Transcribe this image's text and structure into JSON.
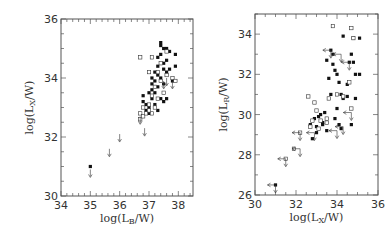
{
  "chart_data": [
    {
      "type": "scatter",
      "title": "",
      "xlabel": "log(L_B/W)",
      "ylabel": "log(L_X/W)",
      "xlim": [
        34,
        38.5
      ],
      "ylim": [
        30,
        36
      ],
      "xticks": [
        34,
        35,
        36,
        37,
        38
      ],
      "yticks": [
        30,
        32,
        34,
        36
      ],
      "grid": false,
      "legend": null,
      "frame": {
        "x0": 61,
        "x1": 193,
        "y0": 19,
        "y1": 196
      },
      "series": [
        {
          "name": "filled",
          "marker": "filled-square",
          "points": [
            [
              35.0,
              31.0
            ],
            [
              36.8,
              33.4
            ],
            [
              36.8,
              33.2
            ],
            [
              36.9,
              32.9
            ],
            [
              37.0,
              33.0
            ],
            [
              37.1,
              33.3
            ],
            [
              37.1,
              33.6
            ],
            [
              37.2,
              33.9
            ],
            [
              37.2,
              34.2
            ],
            [
              37.3,
              34.4
            ],
            [
              37.3,
              34.7
            ],
            [
              37.4,
              35.1
            ],
            [
              37.4,
              34.8
            ],
            [
              37.5,
              35.0
            ],
            [
              37.5,
              34.5
            ],
            [
              37.6,
              34.2
            ],
            [
              37.4,
              34.0
            ],
            [
              37.3,
              33.7
            ],
            [
              37.2,
              33.5
            ],
            [
              37.5,
              33.8
            ],
            [
              37.6,
              34.6
            ],
            [
              37.7,
              34.9
            ],
            [
              37.6,
              33.3
            ],
            [
              37.5,
              33.2
            ],
            [
              37.9,
              34.8
            ],
            [
              37.9,
              34.4
            ],
            [
              37.8,
              33.9
            ],
            [
              37.0,
              33.5
            ],
            [
              37.2,
              33.1
            ],
            [
              37.4,
              33.3
            ],
            [
              37.1,
              34.0
            ],
            [
              37.3,
              34.1
            ],
            [
              37.5,
              34.3
            ],
            [
              37.7,
              34.3
            ],
            [
              37.4,
              35.2
            ],
            [
              37.6,
              35.0
            ],
            [
              36.9,
              33.1
            ],
            [
              37.1,
              33.8
            ],
            [
              37.3,
              32.9
            ],
            [
              37.0,
              32.8
            ]
          ]
        },
        {
          "name": "open",
          "marker": "open-square",
          "points": [
            [
              36.7,
              32.8
            ],
            [
              36.7,
              32.6
            ],
            [
              36.8,
              32.7
            ],
            [
              36.9,
              32.8
            ],
            [
              37.0,
              33.1
            ],
            [
              37.1,
              32.8
            ],
            [
              37.2,
              33.0
            ],
            [
              37.1,
              33.4
            ],
            [
              37.0,
              34.2
            ],
            [
              37.1,
              34.7
            ],
            [
              36.7,
              34.7
            ],
            [
              37.3,
              34.2
            ],
            [
              37.4,
              33.9
            ],
            [
              37.6,
              34.1
            ],
            [
              37.8,
              34.0
            ],
            [
              37.9,
              33.9
            ],
            [
              37.5,
              33.5
            ],
            [
              37.3,
              33.3
            ],
            [
              37.2,
              33.7
            ],
            [
              37.4,
              34.5
            ],
            [
              37.6,
              34.9
            ],
            [
              37.0,
              32.9
            ],
            [
              36.8,
              33.0
            ]
          ]
        },
        {
          "name": "upper-limits",
          "marker": "down-arrow",
          "points": [
            [
              35.0,
              30.9
            ],
            [
              35.65,
              31.6
            ],
            [
              36.0,
              32.1
            ],
            [
              36.85,
              32.3
            ],
            [
              36.7,
              32.7
            ],
            [
              37.5,
              33.9
            ],
            [
              37.8,
              33.9
            ],
            [
              37.6,
              34.0
            ]
          ]
        }
      ]
    },
    {
      "type": "scatter",
      "title": "",
      "xlabel": "log(L_X/W)",
      "ylabel": "log(L_R/W)",
      "xlim": [
        30,
        36
      ],
      "ylim": [
        26,
        35
      ],
      "xticks": [
        30,
        32,
        34,
        36
      ],
      "yticks": [
        26,
        28,
        30,
        32,
        34
      ],
      "grid": false,
      "legend": null,
      "frame": {
        "x0": 255,
        "x1": 378,
        "y0": 14,
        "y1": 195
      },
      "series": [
        {
          "name": "filled",
          "marker": "filled-square",
          "points": [
            [
              31.0,
              26.5
            ],
            [
              32.7,
              29.5
            ],
            [
              32.9,
              29.8
            ],
            [
              33.0,
              29.4
            ],
            [
              33.1,
              29.9
            ],
            [
              33.2,
              30.0
            ],
            [
              33.3,
              29.6
            ],
            [
              33.4,
              30.1
            ],
            [
              33.5,
              29.2
            ],
            [
              33.6,
              31.8
            ],
            [
              33.5,
              32.7
            ],
            [
              33.7,
              33.2
            ],
            [
              33.8,
              33.0
            ],
            [
              33.8,
              32.5
            ],
            [
              33.9,
              32.2
            ],
            [
              34.0,
              32.0
            ],
            [
              34.1,
              31.6
            ],
            [
              34.2,
              31.0
            ],
            [
              34.3,
              30.8
            ],
            [
              34.0,
              30.3
            ],
            [
              33.9,
              29.8
            ],
            [
              34.1,
              29.5
            ],
            [
              34.2,
              29.3
            ],
            [
              34.5,
              31.5
            ],
            [
              34.6,
              32.6
            ],
            [
              34.7,
              33.0
            ],
            [
              34.8,
              32.6
            ],
            [
              34.9,
              32.0
            ],
            [
              34.5,
              30.9
            ],
            [
              34.7,
              29.5
            ],
            [
              34.3,
              33.9
            ],
            [
              34.8,
              33.8
            ],
            [
              35.1,
              33.8
            ],
            [
              35.1,
              32.0
            ],
            [
              34.9,
              30.8
            ],
            [
              33.7,
              31.0
            ],
            [
              33.3,
              29.5
            ],
            [
              33.0,
              29.1
            ],
            [
              32.8,
              28.8
            ]
          ]
        },
        {
          "name": "open",
          "marker": "open-square",
          "points": [
            [
              32.2,
              29.1
            ],
            [
              31.9,
              28.3
            ],
            [
              31.5,
              27.8
            ],
            [
              32.6,
              30.9
            ],
            [
              32.9,
              30.6
            ],
            [
              33.0,
              30.2
            ],
            [
              32.8,
              29.7
            ],
            [
              32.7,
              29.4
            ],
            [
              33.2,
              29.7
            ],
            [
              33.5,
              29.8
            ],
            [
              33.8,
              34.4
            ],
            [
              34.7,
              34.3
            ],
            [
              34.8,
              33.8
            ],
            [
              34.0,
              31.0
            ],
            [
              34.3,
              30.9
            ],
            [
              34.6,
              31.6
            ],
            [
              34.7,
              30.3
            ],
            [
              33.6,
              30.8
            ],
            [
              33.5,
              29.6
            ],
            [
              33.1,
              29.3
            ]
          ]
        },
        {
          "name": "upper-limits",
          "marker": "arrow",
          "points": [
            [
              31.0,
              26.5
            ],
            [
              31.5,
              27.8
            ],
            [
              32.2,
              28.3
            ],
            [
              32.2,
              29.1
            ],
            [
              32.9,
              29.1
            ],
            [
              33.7,
              33.2
            ],
            [
              34.2,
              33.0
            ],
            [
              34.6,
              32.6
            ],
            [
              34.7,
              30.1
            ],
            [
              34.0,
              29.2
            ],
            [
              34.3,
              29.4
            ]
          ]
        }
      ]
    }
  ]
}
